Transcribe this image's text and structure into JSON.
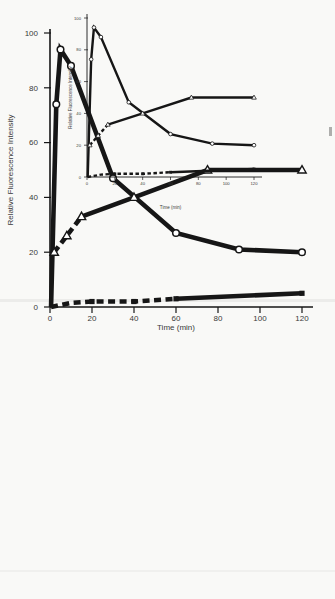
{
  "colors": {
    "ink": "#161616",
    "label_text": "#3a3a3a",
    "paper": "#f9f9f7"
  },
  "chart_data": [
    {
      "name": "large-plot",
      "type": "line",
      "title": "",
      "xlabel": "Time (min)",
      "ylabel": "Relative Fluorescence Intensity",
      "xlim": [
        0,
        120
      ],
      "ylim": [
        0,
        100
      ],
      "xticks": [
        0,
        20,
        40,
        60,
        80,
        100,
        120
      ],
      "yticks": [
        0,
        20,
        40,
        60,
        80,
        100
      ],
      "grid": false,
      "legend": null,
      "series": [
        {
          "name": "open-circle-series",
          "marker": "open-circle",
          "segments": [
            {
              "dashed": false,
              "points": [
                [
                  0.5,
                  0
                ],
                [
                  3,
                  74
                ],
                [
                  5,
                  94
                ],
                [
                  10,
                  88
                ],
                [
                  30,
                  47
                ],
                [
                  60,
                  27
                ],
                [
                  90,
                  21
                ],
                [
                  120,
                  20
                ]
              ]
            }
          ],
          "markers": [
            [
              3,
              74
            ],
            [
              5,
              94
            ],
            [
              10,
              88
            ],
            [
              30,
              47
            ],
            [
              60,
              27
            ],
            [
              90,
              21
            ],
            [
              120,
              20
            ]
          ]
        },
        {
          "name": "open-triangle-series",
          "marker": "open-triangle",
          "segments": [
            {
              "dashed": true,
              "points": [
                [
                  2,
                  20
                ],
                [
                  8,
                  26
                ],
                [
                  15,
                  33
                ]
              ]
            },
            {
              "dashed": false,
              "points": [
                [
                  15,
                  33
                ],
                [
                  40,
                  40
                ],
                [
                  75,
                  50
                ],
                [
                  120,
                  50
                ]
              ]
            }
          ],
          "markers": [
            [
              2,
              20
            ],
            [
              8,
              26
            ],
            [
              15,
              33
            ],
            [
              40,
              40
            ],
            [
              75,
              50
            ],
            [
              120,
              50
            ]
          ]
        },
        {
          "name": "filled-square-series",
          "marker": "filled-square",
          "segments": [
            {
              "dashed": true,
              "points": [
                [
                  0.5,
                  0
                ],
                [
                  10,
                  1.5
                ],
                [
                  20,
                  2
                ],
                [
                  40,
                  2
                ],
                [
                  60,
                  3
                ]
              ]
            },
            {
              "dashed": false,
              "points": [
                [
                  60,
                  3
                ],
                [
                  120,
                  5
                ]
              ]
            }
          ],
          "markers": [
            [
              20,
              2
            ],
            [
              40,
              2
            ],
            [
              60,
              3
            ],
            [
              120,
              5
            ]
          ]
        }
      ]
    },
    {
      "name": "small-plot",
      "type": "line",
      "title": "",
      "xlabel": "Time (min)",
      "ylabel": "Relative Fluorescence Intensity",
      "xlim": [
        0,
        120
      ],
      "ylim": [
        0,
        100
      ],
      "xticks": [
        0,
        20,
        40,
        60,
        80,
        100,
        120
      ],
      "yticks": [
        0,
        20,
        40,
        60,
        80,
        100
      ],
      "grid": false,
      "legend": null,
      "series": [
        {
          "name": "open-circle-series",
          "marker": "open-circle",
          "segments": [
            {
              "dashed": false,
              "points": [
                [
                  0.5,
                  0
                ],
                [
                  3,
                  74
                ],
                [
                  5,
                  94
                ],
                [
                  10,
                  88
                ],
                [
                  30,
                  47
                ],
                [
                  60,
                  27
                ],
                [
                  90,
                  21
                ],
                [
                  120,
                  20
                ]
              ]
            }
          ],
          "markers": [
            [
              3,
              74
            ],
            [
              5,
              94
            ],
            [
              10,
              88
            ],
            [
              30,
              47
            ],
            [
              60,
              27
            ],
            [
              90,
              21
            ],
            [
              120,
              20
            ]
          ]
        },
        {
          "name": "open-triangle-series",
          "marker": "open-triangle",
          "segments": [
            {
              "dashed": true,
              "points": [
                [
                  2,
                  20
                ],
                [
                  8,
                  26
                ],
                [
                  15,
                  33
                ]
              ]
            },
            {
              "dashed": false,
              "points": [
                [
                  15,
                  33
                ],
                [
                  40,
                  40
                ],
                [
                  75,
                  50
                ],
                [
                  120,
                  50
                ]
              ]
            }
          ],
          "markers": [
            [
              2,
              20
            ],
            [
              8,
              26
            ],
            [
              15,
              33
            ],
            [
              40,
              40
            ],
            [
              75,
              50
            ],
            [
              120,
              50
            ]
          ]
        },
        {
          "name": "filled-square-series",
          "marker": "filled-square",
          "segments": [
            {
              "dashed": true,
              "points": [
                [
                  0.5,
                  0
                ],
                [
                  10,
                  1.5
                ],
                [
                  20,
                  2
                ],
                [
                  40,
                  2
                ],
                [
                  60,
                  3
                ]
              ]
            },
            {
              "dashed": false,
              "points": [
                [
                  60,
                  3
                ],
                [
                  120,
                  5
                ]
              ]
            }
          ],
          "markers": [
            [
              20,
              2
            ],
            [
              40,
              2
            ],
            [
              60,
              3
            ],
            [
              120,
              5
            ]
          ]
        }
      ]
    }
  ]
}
